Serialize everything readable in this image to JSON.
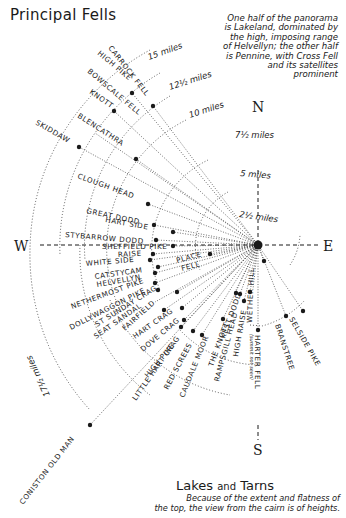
{
  "title": "Principal Fells",
  "note": [
    "One half of the panorama",
    "is Lakeland, dominated by",
    "the high, imposing range",
    "of Helvellyn; the other half",
    "is Pennine, with Cross Fell",
    "and its satellites",
    "prominent"
  ],
  "compass": {
    "north": "N",
    "south": "S",
    "east": "E",
    "west": "W"
  },
  "distances": {
    "d1": "2½ miles",
    "d2": "5 miles",
    "d3": "7½ miles",
    "d4": "10 miles",
    "d5": "12½ miles",
    "d6": "15 miles",
    "d7": "17½ miles"
  },
  "fells": {
    "carrock_fell": "CARROCK FELL",
    "high_pike": "HIGH PIKE",
    "bowscale_fell": "BOWSCALE FELL",
    "knott": "KNOTT",
    "blencathra": "BLENCATHRA",
    "skiddaw": "SKIDDAW",
    "clough_head": "CLOUGH HEAD",
    "great_dodd": "GREAT DODD",
    "hart_side": "HART SIDE",
    "stybarrow_dodd": "STYBARROW DODD",
    "sheffield_pike": "SHEFFIELD PIKE",
    "raise": "RAISE",
    "white_side": "WHITE SIDE",
    "catstycam": "CATSTYCAM",
    "helvellyn": "HELVELLYN",
    "place_fell_1": "PLACE",
    "place_fell_2": "FELL",
    "nethermost_pike": "NETHERMOST PIKE",
    "dollywaggon_pike": "DOLLYWAGGON PIKE",
    "st_sunday_crag": "ST SUNDAY CRAG",
    "seat_sandal": "SEAT SANDAL",
    "fairfield": "FAIRFIELD",
    "hart_crag": "HART CRAG",
    "dove_crag": "DOVE CRAG",
    "high_pike_2": "HIGH PIKE",
    "little_hart_crag": "LITTLE HART CRAG",
    "red_screes": "RED SCREES",
    "caudale_moor": "CAUDALE MOOR",
    "the_knott": "THE KNOTT",
    "rampsgill_head": "RAMPSGILL HEAD",
    "kest_dodd": "KEST DODD",
    "high_raise": "HIGH RAISE",
    "wether_hill": "WETHER HILL",
    "harter_fell": "HARTER FELL",
    "harter_fell_note": "(summit not seen)",
    "branstree": "BRANSTREE",
    "selside_pike": "SELSIDE PIKE",
    "coniston_old_man": "CONISTON OLD MAN"
  },
  "lakes": {
    "title_a": "Lakes ",
    "title_b": "and",
    "title_c": " Tarns",
    "note": [
      "Because of the extent and flatness of",
      "the top, the view from the cairn is of heights."
    ]
  }
}
